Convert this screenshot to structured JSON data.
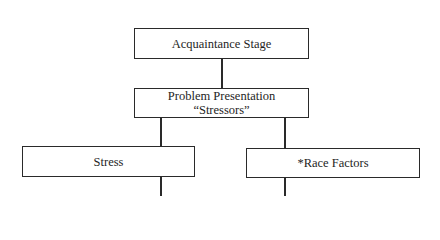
{
  "diagram": {
    "type": "flowchart",
    "nodes": [
      {
        "id": "acquaintance",
        "lines": [
          "Acquaintance Stage"
        ]
      },
      {
        "id": "problem",
        "lines": [
          "Problem Presentation",
          "“Stressors”"
        ]
      },
      {
        "id": "stress",
        "lines": [
          "Stress"
        ]
      },
      {
        "id": "race",
        "lines": [
          "*Race Factors"
        ]
      }
    ],
    "edges": [
      {
        "from": "acquaintance",
        "to": "problem"
      },
      {
        "from": "problem",
        "to": "stress"
      },
      {
        "from": "problem",
        "to": "race"
      },
      {
        "from": "stress",
        "to": "continues-below"
      },
      {
        "from": "race",
        "to": "continues-below"
      }
    ]
  }
}
